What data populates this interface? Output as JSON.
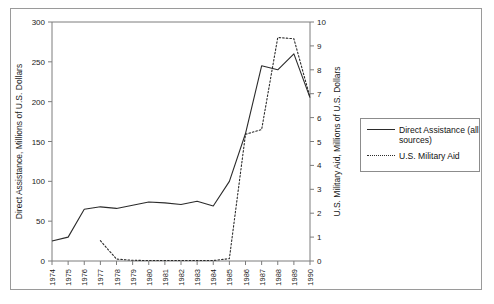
{
  "chart_data": {
    "type": "line",
    "title": "",
    "xlabel": "",
    "x": [
      1974,
      1975,
      1976,
      1977,
      1978,
      1979,
      1980,
      1981,
      1982,
      1983,
      1984,
      1985,
      1986,
      1987,
      1988,
      1989,
      1990
    ],
    "xtick_labels": [
      "1974",
      "1975",
      "1976",
      "1977",
      "1978",
      "1979",
      "1980",
      "1981",
      "1982",
      "1983",
      "1984",
      "1985",
      "1986",
      "1987",
      "1988",
      "1989",
      "1990"
    ],
    "grid": false,
    "legend_position": "right",
    "axes": [
      {
        "id": "left",
        "label": "Direct Assistance, Millions of U.S. Dollars",
        "ylim": [
          0,
          300
        ],
        "ticks": [
          0,
          50,
          100,
          150,
          200,
          250,
          300
        ],
        "tick_labels": [
          "0",
          "50",
          "100",
          "150",
          "200",
          "250",
          "300"
        ]
      },
      {
        "id": "right",
        "label": "U.S. Military Aid, Millions of U.S. Dollars",
        "ylim": [
          0,
          10
        ],
        "ticks": [
          0,
          1,
          2,
          3,
          4,
          5,
          6,
          7,
          8,
          9,
          10
        ],
        "tick_labels": [
          "0",
          "1",
          "2",
          "3",
          "4",
          "5",
          "6",
          "7",
          "8",
          "9",
          "10"
        ]
      }
    ],
    "series": [
      {
        "name": "Direct Assistance (all sources)",
        "axis": "left",
        "style": "solid",
        "color": "#2b2b2b",
        "values": [
          25,
          30,
          65,
          68,
          66,
          70,
          74,
          73,
          71,
          75,
          69,
          100,
          160,
          245,
          240,
          260,
          205
        ]
      },
      {
        "name": "U.S. Military Aid",
        "axis": "right",
        "style": "dotted",
        "color": "#2b2b2b",
        "values": [
          null,
          null,
          null,
          0.85,
          0.08,
          0.03,
          0.02,
          0.02,
          0.02,
          0.02,
          0.02,
          0.1,
          5.3,
          5.5,
          9.35,
          9.3,
          6.85
        ]
      }
    ]
  },
  "legend": {
    "entries": [
      {
        "label": "Direct Assistance (all sources)",
        "style": "solid"
      },
      {
        "label": "U.S. Military Aid",
        "style": "dotted"
      }
    ]
  }
}
